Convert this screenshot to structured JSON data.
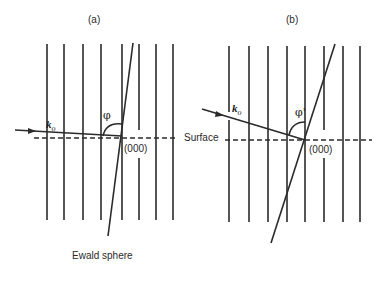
{
  "diagram": {
    "panels": [
      {
        "id": "a",
        "label": "(a)",
        "incident_label_main": "k",
        "incident_label_sub": "o",
        "angle_label": "φ",
        "origin_label": "(000)",
        "sphere_label": "Ewald sphere"
      },
      {
        "id": "b",
        "label": "(b)",
        "incident_label_main": "k",
        "incident_label_sub": "o",
        "angle_label": "φ'",
        "origin_label": "(000)"
      }
    ],
    "surface_label": "Surface",
    "colors": {
      "line": "#2b2b2b",
      "background": "#ffffff"
    }
  }
}
